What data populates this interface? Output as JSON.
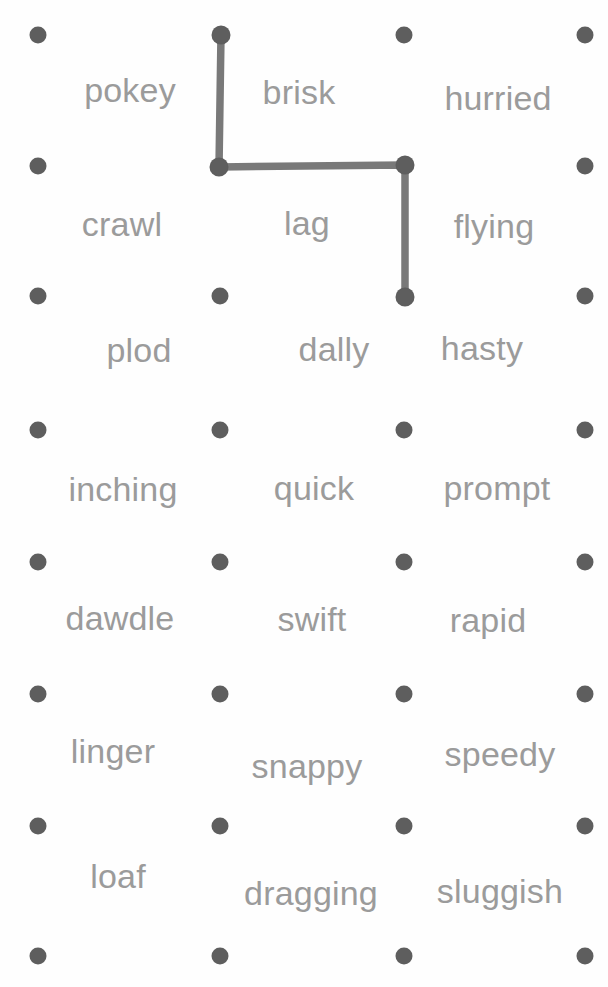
{
  "canvas": {
    "width": 608,
    "height": 987,
    "background_color": "#fefefe"
  },
  "style": {
    "dot_color": "#5e5e5e",
    "dot_radius": 8.5,
    "word_color": "#9b9b9b",
    "word_font_size": 34,
    "path_color": "#6f6f6f",
    "path_width": 7.5
  },
  "grid": {
    "columns": 4,
    "rows": 8,
    "column_x": [
      38,
      220,
      404,
      585
    ],
    "row_y": [
      35,
      166,
      296,
      430,
      562,
      694,
      826,
      956
    ]
  },
  "dots": [
    {
      "id": "r0c0",
      "x": 38,
      "y": 35
    },
    {
      "id": "r0c1",
      "x": 221,
      "y": 35
    },
    {
      "id": "r0c2",
      "x": 404,
      "y": 35
    },
    {
      "id": "r0c3",
      "x": 585,
      "y": 35
    },
    {
      "id": "r1c0",
      "x": 38,
      "y": 166
    },
    {
      "id": "r1c1",
      "x": 219,
      "y": 167
    },
    {
      "id": "r1c2",
      "x": 405,
      "y": 165
    },
    {
      "id": "r1c3",
      "x": 585,
      "y": 166
    },
    {
      "id": "r2c0",
      "x": 38,
      "y": 296
    },
    {
      "id": "r2c1",
      "x": 220,
      "y": 296
    },
    {
      "id": "r2c2",
      "x": 405,
      "y": 297
    },
    {
      "id": "r2c3",
      "x": 585,
      "y": 296
    },
    {
      "id": "r3c0",
      "x": 38,
      "y": 430
    },
    {
      "id": "r3c1",
      "x": 220,
      "y": 430
    },
    {
      "id": "r3c2",
      "x": 404,
      "y": 430
    },
    {
      "id": "r3c3",
      "x": 585,
      "y": 430
    },
    {
      "id": "r4c0",
      "x": 38,
      "y": 562
    },
    {
      "id": "r4c1",
      "x": 220,
      "y": 562
    },
    {
      "id": "r4c2",
      "x": 404,
      "y": 562
    },
    {
      "id": "r4c3",
      "x": 585,
      "y": 562
    },
    {
      "id": "r5c0",
      "x": 38,
      "y": 694
    },
    {
      "id": "r5c1",
      "x": 220,
      "y": 694
    },
    {
      "id": "r5c2",
      "x": 404,
      "y": 694
    },
    {
      "id": "r5c3",
      "x": 585,
      "y": 694
    },
    {
      "id": "r6c0",
      "x": 38,
      "y": 826
    },
    {
      "id": "r6c1",
      "x": 220,
      "y": 826
    },
    {
      "id": "r6c2",
      "x": 404,
      "y": 826
    },
    {
      "id": "r6c3",
      "x": 585,
      "y": 826
    },
    {
      "id": "r7c0",
      "x": 38,
      "y": 956
    },
    {
      "id": "r7c1",
      "x": 220,
      "y": 956
    },
    {
      "id": "r7c2",
      "x": 404,
      "y": 956
    },
    {
      "id": "r7c3",
      "x": 585,
      "y": 956
    }
  ],
  "words": [
    {
      "text": "pokey",
      "x": 130,
      "y": 107
    },
    {
      "text": "brisk",
      "x": 299,
      "y": 109
    },
    {
      "text": "hurried",
      "x": 498,
      "y": 115
    },
    {
      "text": "crawl",
      "x": 122,
      "y": 241
    },
    {
      "text": "lag",
      "x": 307,
      "y": 240
    },
    {
      "text": "flying",
      "x": 494,
      "y": 243
    },
    {
      "text": "plod",
      "x": 139,
      "y": 367
    },
    {
      "text": "dally",
      "x": 334,
      "y": 366
    },
    {
      "text": "hasty",
      "x": 482,
      "y": 365
    },
    {
      "text": "inching",
      "x": 123,
      "y": 506
    },
    {
      "text": "quick",
      "x": 314,
      "y": 505
    },
    {
      "text": "prompt",
      "x": 497,
      "y": 505
    },
    {
      "text": "dawdle",
      "x": 120,
      "y": 635
    },
    {
      "text": "swift",
      "x": 312,
      "y": 636
    },
    {
      "text": "rapid",
      "x": 488,
      "y": 637
    },
    {
      "text": "linger",
      "x": 113,
      "y": 768
    },
    {
      "text": "snappy",
      "x": 307,
      "y": 783
    },
    {
      "text": "speedy",
      "x": 500,
      "y": 771
    },
    {
      "text": "loaf",
      "x": 118,
      "y": 893
    },
    {
      "text": "dragging",
      "x": 311,
      "y": 910
    },
    {
      "text": "sluggish",
      "x": 500,
      "y": 908
    }
  ],
  "path": {
    "points": [
      {
        "x": 221,
        "y": 35
      },
      {
        "x": 219,
        "y": 167
      },
      {
        "x": 405,
        "y": 165
      },
      {
        "x": 405,
        "y": 297
      }
    ],
    "node_radius": 9.5,
    "color": "#6f6f6f"
  }
}
